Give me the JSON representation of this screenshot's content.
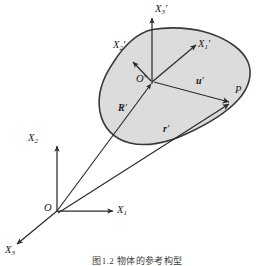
{
  "figure": {
    "type": "vector-diagram",
    "background_color": "#ffffff",
    "stroke_color": "#2b2b2b",
    "region_fill_color": "#dcdcdc",
    "region_stroke_color": "#3a3a3a",
    "caption": "图1.2  物体的参考构型"
  },
  "labels": {
    "origin_global": "O",
    "axis_x1": "X",
    "axis_x1_sub": "1",
    "axis_x2": "X",
    "axis_x2_sub": "2",
    "axis_x3": "X",
    "axis_x3_sub": "3",
    "origin_local": "O",
    "origin_local_prime": "'",
    "axis_x1p": "X",
    "axis_x1p_sub": "1",
    "axis_x1p_prime": "'",
    "axis_x2p": "X",
    "axis_x2p_sub": "2",
    "axis_x2p_prime": "'",
    "axis_x3p": "X",
    "axis_x3p_sub": "3",
    "axis_x3p_prime": "'",
    "region": "R",
    "region_prime": "'",
    "vector_u": "u",
    "vector_u_prime": "'",
    "vector_r": "r",
    "vector_r_prime": "'",
    "point_p": "P"
  },
  "geometry": {
    "global_origin": [
      57,
      211
    ],
    "local_origin": [
      152,
      81
    ],
    "point_p": [
      233,
      101
    ],
    "region_centroid": [
      170,
      85
    ]
  }
}
